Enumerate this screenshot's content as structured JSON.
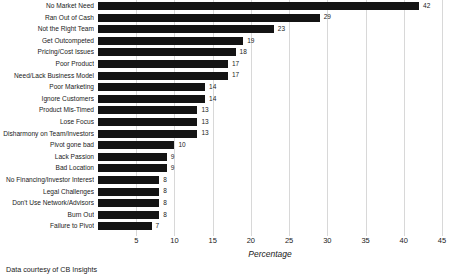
{
  "chart_data": {
    "type": "bar",
    "orientation": "horizontal",
    "title": "",
    "xlabel": "Percentage",
    "ylabel": "",
    "xlim": [
      0,
      45
    ],
    "xticks": [
      5,
      10,
      15,
      20,
      25,
      30,
      35,
      40,
      45
    ],
    "grid": true,
    "legend": null,
    "bar_color": "#141414",
    "gridline_color": "#d8d8d8",
    "show_value_labels": true,
    "categories": [
      "No Market Need",
      "Ran Out of Cash",
      "Not the Right Team",
      "Get Outcompeted",
      "Pricing/Cost Issues",
      "Poor Product",
      "Need/Lack Business Model",
      "Poor Marketing",
      "Ignore Customers",
      "Product Mis-Timed",
      "Lose Focus",
      "Disharmony on Team/Investors",
      "Pivot gone bad",
      "Lack Passion",
      "Bad Location",
      "No Financing/Investor Interest",
      "Legal Challenges",
      "Don't Use Network/Advisors",
      "Burn Out",
      "Failure to Pivot"
    ],
    "values": [
      42,
      29,
      23,
      19,
      18,
      17,
      17,
      14,
      14,
      13,
      13,
      13,
      10,
      9,
      9,
      8,
      8,
      8,
      8,
      7
    ]
  },
  "caption": "Data courtesy of CB Insights"
}
